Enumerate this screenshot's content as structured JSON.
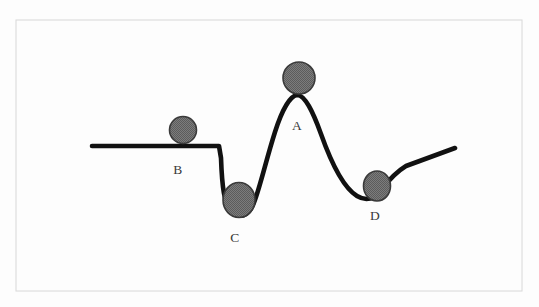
{
  "figure": {
    "width": 539,
    "height": 307,
    "background_color": "#fdfdfd",
    "frame": {
      "stroke_color": "#d8d8d8",
      "x": 16,
      "y": 20,
      "width": 506,
      "height": 271
    },
    "curve": {
      "stroke_color": "#111111",
      "stroke_width": 4.6,
      "path": "M 92 146 L 219 146 L 221 158 C 222 186 224 205 232 212 C 240 219 248 216 253 205 C 259 192 266 160 275 132 C 282 110 290 96 297 95 C 305 95 313 112 321 134 C 332 165 344 188 357 196 C 367 202 374 199 381 190 C 388 181 396 172 406 166 L 455 148"
    },
    "balls": [
      {
        "id": "ball-a",
        "label": "A",
        "cx": 299,
        "cy": 78,
        "rx": 16,
        "ry": 16,
        "fill_color": "#6e6e6e",
        "stroke_color": "#3a3a3a",
        "label_x": 297,
        "label_y": 126,
        "state": "peak"
      },
      {
        "id": "ball-b",
        "label": "B",
        "cx": 183,
        "cy": 130,
        "rx": 13.5,
        "ry": 13.5,
        "fill_color": "#6e6e6e",
        "stroke_color": "#3a3a3a",
        "label_x": 178,
        "label_y": 170,
        "state": "plateau"
      },
      {
        "id": "ball-c",
        "label": "C",
        "cx": 239,
        "cy": 200,
        "rx": 16,
        "ry": 17.5,
        "fill_color": "#6e6e6e",
        "stroke_color": "#3a3a3a",
        "label_x": 235,
        "label_y": 238,
        "state": "deep-valley"
      },
      {
        "id": "ball-d",
        "label": "D",
        "cx": 377,
        "cy": 186,
        "rx": 13.5,
        "ry": 15,
        "fill_color": "#6e6e6e",
        "stroke_color": "#3a3a3a",
        "label_x": 375,
        "label_y": 216,
        "state": "shallow-valley"
      }
    ]
  }
}
